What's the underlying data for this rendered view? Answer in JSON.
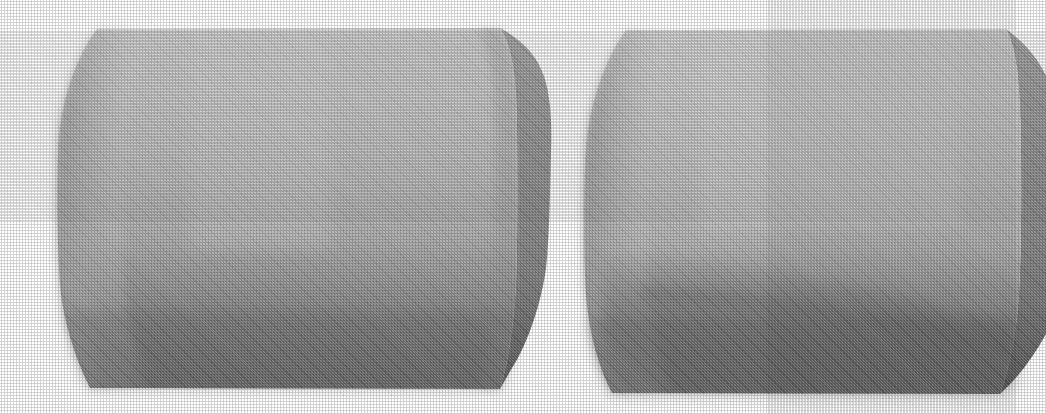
{
  "figure": {
    "background_color": "#ffffff",
    "width": 1046,
    "height": 414,
    "render_style": "halftone-dithered grayscale shaded solid",
    "object_count": 2
  },
  "chart_data": {
    "type": "scatter",
    "xlabel": "",
    "ylabel": "",
    "objects": [
      {
        "name": "left-solid",
        "label": "Left solid: rounded-edge extruded block, front-left view",
        "bounding_box": {
          "x": 40,
          "y": 26,
          "width": 515,
          "height": 366
        },
        "faces": [
          {
            "name": "front-face",
            "shading": "vertical gradient, light top to dark bottom",
            "top_color": "#cbcbcb",
            "mid_color": "#a8a8a8",
            "bottom_color": "#6d6d6d",
            "outline_points": "97,29 500,28 513,40 516,300 498,389 90,388 63,300 58,120"
          },
          {
            "name": "right-side-face",
            "shading": "vertical gradient, medium top to dark bottom",
            "top_color": "#9d9d9d",
            "mid_color": "#8a8a8a",
            "bottom_color": "#585858",
            "outline_points": "500,28 540,70 551,150 548,250 512,360 498,389 513,300 516,140"
          }
        ],
        "silhouette_points": "97,29 500,28 537,66 551,150 546,260 500,389 90,388 62,300 57,130"
      },
      {
        "name": "right-solid",
        "label": "Right solid: same block rotated, crease visible near lower centre",
        "bounding_box": {
          "x": 585,
          "y": 27,
          "width": 461,
          "height": 370
        },
        "faces": [
          {
            "name": "front-face",
            "shading": "vertical gradient with creased lower region",
            "top_color": "#cfcfcf",
            "mid_color": "#b0b0b0",
            "bottom_color": "#6c6c6c",
            "outline_points": "626,30 1006,29 1018,60 1020,300 1000,394 612,393 589,300 585,120"
          },
          {
            "name": "right-side-face",
            "shading": "vertical gradient, medium to dark",
            "top_color": "#9b9b9b",
            "mid_color": "#8d8d8d",
            "bottom_color": "#5a5a5a",
            "outline_points": "1006,29 1046,74 1046,330 1000,394 1020,300 1018,60"
          },
          {
            "name": "lower-crease-shadow",
            "shading": "soft diagonal crease / self-shadow across lower half",
            "color": "#808080"
          }
        ],
        "silhouette_points": "626,30 1006,29 1046,74 1046,330 1000,394 612,393 588,300 584,120"
      }
    ],
    "palette": {
      "paper_white": "#ffffff",
      "front_highlight": "#d2d2d2",
      "front_midtone": "#a9a9a9",
      "front_shadow": "#696969",
      "side_highlight": "#9e9e9e",
      "side_midtone": "#868686",
      "side_shadow": "#555555"
    },
    "annotations": [],
    "legend": [],
    "grid": false
  }
}
